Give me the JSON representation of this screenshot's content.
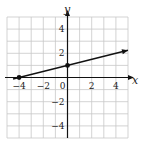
{
  "chart_data": {
    "type": "line",
    "title": "",
    "xlabel": "x",
    "ylabel": "y",
    "xlim": [
      -5,
      5
    ],
    "ylim": [
      -5,
      5
    ],
    "grid": true,
    "x_ticks": [
      -4,
      -2,
      0,
      2,
      4
    ],
    "y_ticks": [
      4,
      2,
      -2,
      -4
    ],
    "x_tick_labels": [
      "−4",
      "−2",
      "0",
      "2",
      "4"
    ],
    "y_tick_labels": [
      "4",
      "2",
      "−2",
      "−4"
    ],
    "series": [
      {
        "name": "line",
        "equation": "y = x/4 + 1",
        "x": [
          -4.5,
          5
        ],
        "y": [
          -0.125,
          2.25
        ],
        "arrow_end": true
      }
    ],
    "points": [
      {
        "x": -4,
        "y": 0
      },
      {
        "x": 0,
        "y": 1
      }
    ]
  }
}
